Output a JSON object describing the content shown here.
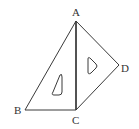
{
  "diagram": {
    "type": "geometry",
    "points": {
      "A": {
        "label": "A"
      },
      "B": {
        "label": "B"
      },
      "C": {
        "label": "C"
      },
      "D": {
        "label": "D"
      }
    },
    "shapes": [
      {
        "name": "triangle-ABC",
        "vertices": [
          "A",
          "B",
          "C"
        ]
      },
      {
        "name": "triangle-ACD",
        "vertices": [
          "A",
          "C",
          "D"
        ]
      }
    ],
    "colors": {
      "stroke": "#3a3a3a",
      "label": "#333333",
      "background": "#ffffff"
    }
  }
}
